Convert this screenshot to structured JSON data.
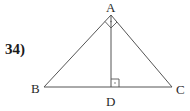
{
  "problem": {
    "number_label": "34)"
  },
  "figure": {
    "vertices": {
      "A": {
        "label": "A",
        "x": 111,
        "y": 15
      },
      "B": {
        "label": "B",
        "x": 44,
        "y": 87
      },
      "C": {
        "label": "C",
        "x": 172,
        "y": 87
      },
      "D": {
        "label": "D",
        "x": 111,
        "y": 87
      }
    },
    "segments": [
      "AB",
      "AC",
      "BC",
      "AD"
    ],
    "right_angles": [
      "BAC",
      "ADB"
    ],
    "stroke_color": "#555555"
  }
}
